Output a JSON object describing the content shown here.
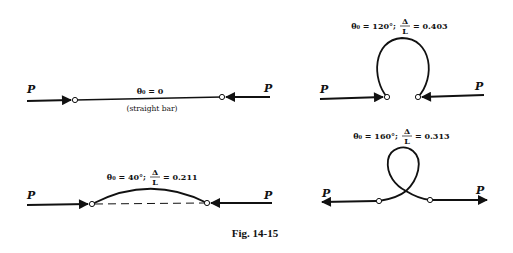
{
  "figure": {
    "caption": "Fig. 14-15",
    "panels": [
      {
        "id": "straight",
        "label": "θ₀ = 0",
        "sublabel": "(straight bar)",
        "force_left": "P",
        "force_right": "P"
      },
      {
        "id": "theta120",
        "label_angle": "θ₀ = 120°;",
        "ratio_num": "Δ",
        "ratio_den": "L",
        "ratio_value": "= 0.403",
        "force_left": "P",
        "force_right": "P"
      },
      {
        "id": "theta40",
        "label_angle": "θ₀ = 40°;",
        "ratio_num": "Δ",
        "ratio_den": "L",
        "ratio_value": "= 0.211",
        "force_left": "P",
        "force_right": "P"
      },
      {
        "id": "theta160",
        "label_angle": "θ₀ = 160°;",
        "ratio_num": "Δ",
        "ratio_den": "L",
        "ratio_value": "= 0.313",
        "force_left": "P",
        "force_right": "P"
      }
    ]
  }
}
